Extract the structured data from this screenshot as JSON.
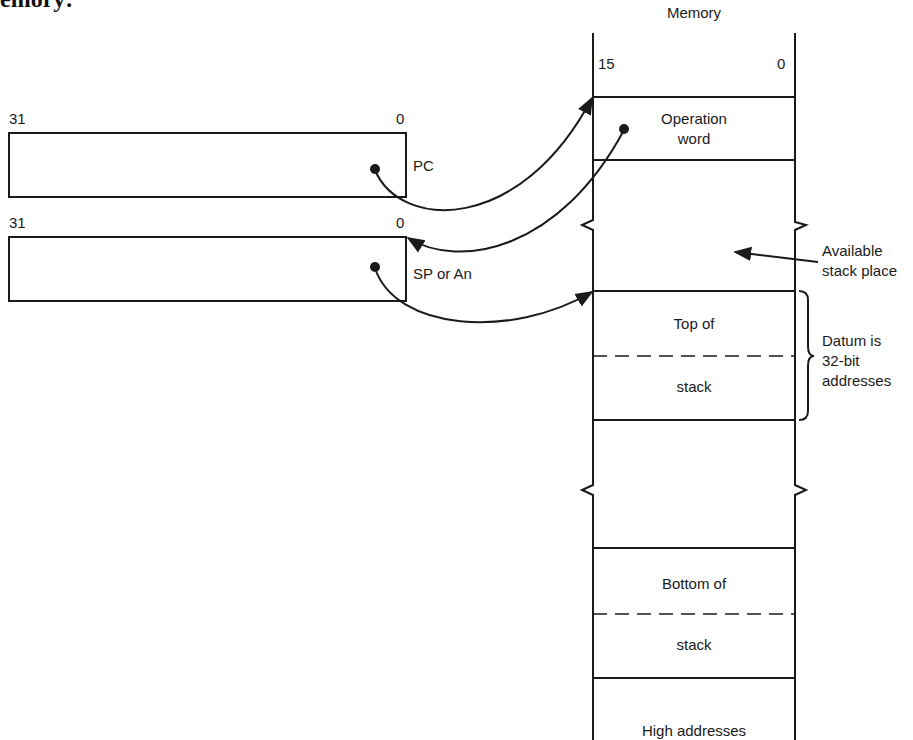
{
  "caption_fragment": "emory:",
  "memory": {
    "title": "Memory",
    "bit_high": "15",
    "bit_low": "0",
    "cells": {
      "operation_word": [
        "Operation",
        "word"
      ],
      "top_of_stack_upper": "Top of",
      "top_of_stack_lower": "stack",
      "bottom_of_stack_upper": "Bottom of",
      "bottom_of_stack_lower": "stack",
      "high_addresses": "High addresses"
    }
  },
  "registers": [
    {
      "name": "PC",
      "bit_high": "31",
      "bit_low": "0"
    },
    {
      "name": "SP or An",
      "bit_high": "31",
      "bit_low": "0"
    }
  ],
  "annotations": {
    "available_stack": [
      "Available",
      "stack place"
    ],
    "datum": [
      "Datum is",
      "32-bit",
      "addresses"
    ]
  },
  "colors": {
    "line": "#1a1a1a",
    "background": "#ffffff"
  }
}
